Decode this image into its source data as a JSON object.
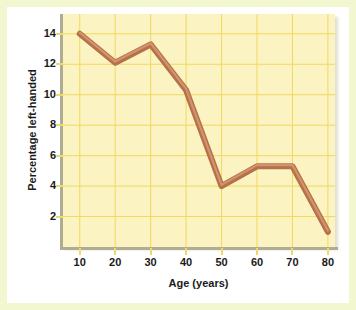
{
  "chart_data": {
    "type": "line",
    "title": "",
    "xlabel": "Age (years)",
    "ylabel": "Percentage left-handed",
    "x": [
      10,
      20,
      30,
      40,
      50,
      60,
      70,
      80
    ],
    "values": [
      14.0,
      12.1,
      13.3,
      10.3,
      4.0,
      5.3,
      5.3,
      1.0
    ],
    "series": [
      {
        "name": "Percentage left-handed",
        "values": [
          14.0,
          12.1,
          13.3,
          10.3,
          4.0,
          5.3,
          5.3,
          1.0
        ]
      }
    ],
    "xlim": [
      5,
      82
    ],
    "ylim": [
      0,
      15.3
    ],
    "xticks": [
      10,
      20,
      30,
      40,
      50,
      60,
      70,
      80
    ],
    "xtick_labels": [
      "10",
      "20",
      "30",
      "40",
      "50",
      "60",
      "70",
      "80"
    ],
    "yticks": [
      2,
      4,
      6,
      8,
      10,
      12,
      14
    ],
    "ytick_labels": [
      "2",
      "4",
      "6",
      "8",
      "10",
      "12",
      "14"
    ],
    "grid": true,
    "legend": "none",
    "colors": {
      "line": "#b5724a",
      "line_highlight": "#d79a72",
      "plot_background": "#fbf3c2",
      "grid": "#f0d95f",
      "axis": "#b0ab93",
      "frame": "#f2f7cf",
      "text": "#1a1a1a"
    }
  }
}
